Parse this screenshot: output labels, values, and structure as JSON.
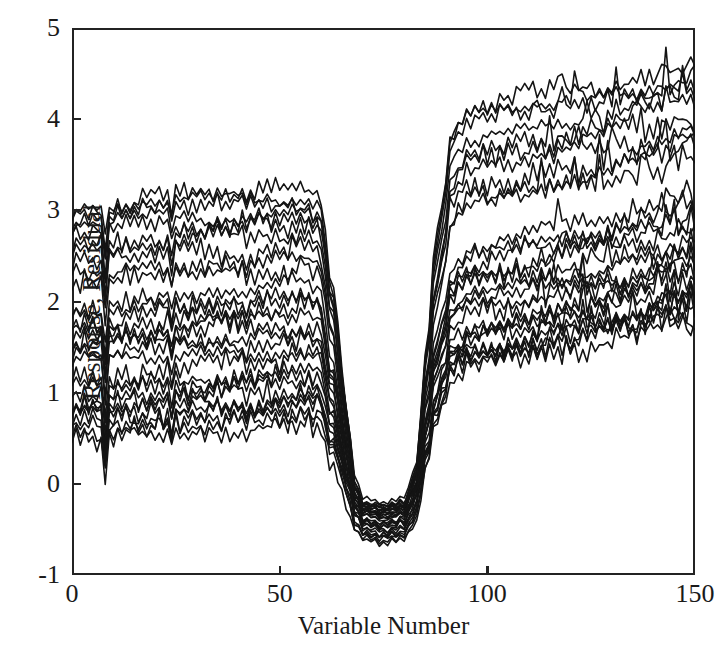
{
  "chart_data": {
    "type": "line",
    "title": "",
    "subtitle": "",
    "xlabel": "Variable Number",
    "ylabel": "Response, Residual",
    "xlim": [
      0,
      150
    ],
    "ylim": [
      -1,
      5
    ],
    "xticks": [
      0,
      50,
      100,
      150
    ],
    "yticks": [
      -1,
      0,
      1,
      2,
      3,
      4,
      5
    ],
    "xtick_labels": [
      "0",
      "50",
      "100",
      "150"
    ],
    "ytick_labels": [
      "-1",
      "0",
      "1",
      "2",
      "3",
      "4",
      "5"
    ],
    "grid": false,
    "legend": "none",
    "line_color": "#141414",
    "line_width": 1.6,
    "background": "#ffffff",
    "axis_color": "#232323",
    "n_series": 30,
    "n_points_per_series": 151,
    "notes": [
      "All series share a common shape with a synchronized downward spike near variable 8.",
      "Left plateaus centred near 0.70, 1.55 and 2.95; dip floor near -0.45; right plateaus centred near 1.90 and 3.65.",
      "Right edge values span roughly 1.3 to 4.6; peak excursion reaches about 4.85 near variable 147."
    ],
    "series": [
      {
        "name": "trace-01",
        "baseline_left": 3.05,
        "baseline_right": 4.05,
        "dip": -0.3,
        "offset": 0.0
      },
      {
        "name": "trace-02",
        "baseline_left": 2.98,
        "baseline_right": 3.95,
        "dip": -0.35,
        "offset": 0.03
      },
      {
        "name": "trace-03",
        "baseline_left": 2.9,
        "baseline_right": 3.88,
        "dip": -0.28,
        "offset": 0.06
      },
      {
        "name": "trace-04",
        "baseline_left": 2.82,
        "baseline_right": 3.75,
        "dip": -0.4,
        "offset": 0.09
      },
      {
        "name": "trace-05",
        "baseline_left": 2.74,
        "baseline_right": 3.6,
        "dip": -0.22,
        "offset": 0.12
      },
      {
        "name": "trace-06",
        "baseline_left": 2.66,
        "baseline_right": 3.48,
        "dip": -0.45,
        "offset": 0.15
      },
      {
        "name": "trace-07",
        "baseline_left": 2.55,
        "baseline_right": 3.35,
        "dip": -0.33,
        "offset": 0.18
      },
      {
        "name": "trace-08",
        "baseline_left": 2.42,
        "baseline_right": 3.22,
        "dip": -0.5,
        "offset": 0.21
      },
      {
        "name": "trace-09",
        "baseline_left": 2.28,
        "baseline_right": 3.1,
        "dip": -0.26,
        "offset": 0.24
      },
      {
        "name": "trace-10",
        "baseline_left": 2.2,
        "baseline_right": 3.02,
        "dip": -0.55,
        "offset": 0.27
      },
      {
        "name": "trace-11",
        "baseline_left": 1.95,
        "baseline_right": 2.55,
        "dip": -0.31,
        "offset": 0.3
      },
      {
        "name": "trace-12",
        "baseline_left": 1.88,
        "baseline_right": 2.45,
        "dip": -0.48,
        "offset": 0.33
      },
      {
        "name": "trace-13",
        "baseline_left": 1.8,
        "baseline_right": 2.38,
        "dip": -0.24,
        "offset": 0.36
      },
      {
        "name": "trace-14",
        "baseline_left": 1.72,
        "baseline_right": 2.3,
        "dip": -0.6,
        "offset": 0.39
      },
      {
        "name": "trace-15",
        "baseline_left": 1.64,
        "baseline_right": 2.22,
        "dip": -0.36,
        "offset": 0.42
      },
      {
        "name": "trace-16",
        "baseline_left": 1.56,
        "baseline_right": 2.12,
        "dip": -0.42,
        "offset": 0.45
      },
      {
        "name": "trace-17",
        "baseline_left": 1.48,
        "baseline_right": 2.05,
        "dip": -0.29,
        "offset": 0.48
      },
      {
        "name": "trace-18",
        "baseline_left": 1.4,
        "baseline_right": 1.96,
        "dip": -0.52,
        "offset": 0.51
      },
      {
        "name": "trace-19",
        "baseline_left": 1.3,
        "baseline_right": 1.88,
        "dip": -0.38,
        "offset": 0.54
      },
      {
        "name": "trace-20",
        "baseline_left": 1.18,
        "baseline_right": 1.8,
        "dip": -0.65,
        "offset": 0.57
      },
      {
        "name": "trace-21",
        "baseline_left": 1.05,
        "baseline_right": 1.72,
        "dip": -0.27,
        "offset": 0.6
      },
      {
        "name": "trace-22",
        "baseline_left": 0.98,
        "baseline_right": 1.65,
        "dip": -0.47,
        "offset": 0.63
      },
      {
        "name": "trace-23",
        "baseline_left": 0.92,
        "baseline_right": 1.58,
        "dip": -0.34,
        "offset": 0.66
      },
      {
        "name": "trace-24",
        "baseline_left": 0.85,
        "baseline_right": 1.52,
        "dip": -0.58,
        "offset": 0.69
      },
      {
        "name": "trace-25",
        "baseline_left": 0.78,
        "baseline_right": 1.46,
        "dip": -0.25,
        "offset": 0.72
      },
      {
        "name": "trace-26",
        "baseline_left": 0.72,
        "baseline_right": 1.42,
        "dip": -0.44,
        "offset": 0.75
      },
      {
        "name": "trace-27",
        "baseline_left": 0.66,
        "baseline_right": 1.38,
        "dip": -0.32,
        "offset": 0.78
      },
      {
        "name": "trace-28",
        "baseline_left": 0.6,
        "baseline_right": 1.34,
        "dip": -0.56,
        "offset": 0.81
      },
      {
        "name": "trace-29",
        "baseline_left": 0.54,
        "baseline_right": 1.3,
        "dip": -0.23,
        "offset": 0.84
      },
      {
        "name": "trace-30",
        "baseline_left": 0.48,
        "baseline_right": 1.28,
        "dip": -0.62,
        "offset": 0.87
      }
    ],
    "shape_profile": {
      "comment": "Common envelope multiplier by variable number, 0 = dip floor, 1 = plateau level.",
      "x": [
        0,
        55,
        60,
        63,
        66,
        68,
        70,
        75,
        80,
        83,
        85,
        88,
        92,
        96,
        150
      ],
      "plateau_factor": [
        1,
        1,
        0.97,
        0.72,
        0.35,
        0.1,
        0.02,
        0.0,
        0.02,
        0.12,
        0.4,
        0.72,
        0.96,
        1,
        1
      ]
    }
  }
}
